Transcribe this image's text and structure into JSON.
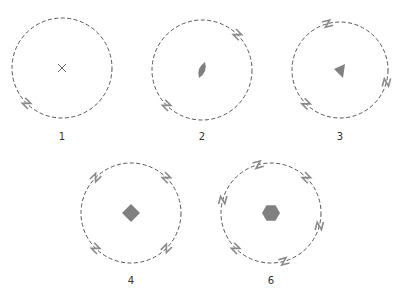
{
  "colors": {
    "circle": "#555555",
    "marker": "#8a8a8a",
    "shape": "#808080"
  },
  "figures": [
    {
      "label": "1",
      "cx": 62,
      "cy": 68,
      "r": 50,
      "n": 1,
      "shape": "cross",
      "start_deg": 225
    },
    {
      "label": "2",
      "cx": 202,
      "cy": 70,
      "r": 50,
      "n": 2,
      "shape": "lens",
      "start_deg": 225
    },
    {
      "label": "3",
      "cx": 340,
      "cy": 70,
      "r": 48,
      "n": 3,
      "shape": "triangle",
      "start_deg": 225
    },
    {
      "label": "4",
      "cx": 131,
      "cy": 213,
      "r": 50,
      "n": 4,
      "shape": "square",
      "start_deg": 225
    },
    {
      "label": "6",
      "cx": 271,
      "cy": 213,
      "r": 50,
      "n": 6,
      "shape": "hexagon",
      "start_deg": 225
    }
  ]
}
